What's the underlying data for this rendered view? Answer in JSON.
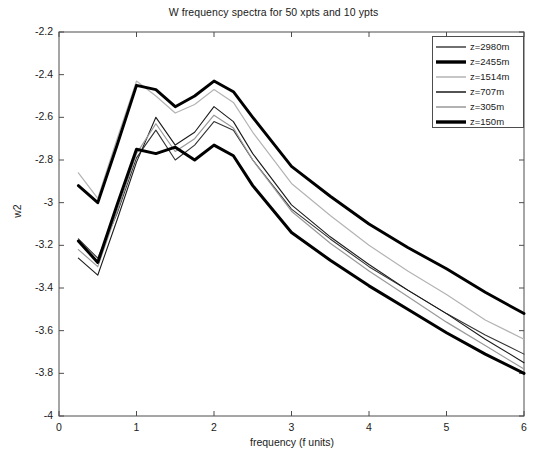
{
  "chart_data": {
    "type": "line",
    "title": "W frequency spectra for 50 xpts and 10 ypts",
    "xlabel": "frequency (f units)",
    "ylabel": "w2",
    "xlim": [
      0,
      6
    ],
    "ylim": [
      -4,
      -2.2
    ],
    "xticks": [
      0,
      1,
      2,
      3,
      4,
      5,
      6
    ],
    "xtick_labels": [
      "0",
      "1",
      "2",
      "3",
      "4",
      "5",
      "6"
    ],
    "yticks": [
      -2.2,
      -2.4,
      -2.6,
      -2.8,
      -3,
      -3.2,
      -3.4,
      -3.6,
      -3.8,
      -4
    ],
    "ytick_labels": [
      "-2.2",
      "-2.4",
      "-2.6",
      "-2.8",
      "-3",
      "-3.2",
      "-3.4",
      "-3.6",
      "-3.8",
      "-4"
    ],
    "grid": false,
    "legend_position": "upper right",
    "x": [
      0.25,
      0.5,
      0.75,
      1.0,
      1.25,
      1.5,
      1.75,
      2.0,
      2.25,
      2.5,
      3.0,
      3.5,
      4.0,
      4.5,
      5.0,
      5.5,
      6.0
    ],
    "series": [
      {
        "name": "z=2980m",
        "color": "#333333",
        "width": 1.1,
        "values": [
          -3.17,
          -3.26,
          -3.05,
          -2.79,
          -2.66,
          -2.8,
          -2.73,
          -2.62,
          -2.66,
          -2.8,
          -3.03,
          -3.17,
          -3.3,
          -3.41,
          -3.52,
          -3.62,
          -3.71
        ]
      },
      {
        "name": "z=2455m",
        "color": "#000000",
        "width": 2.9,
        "values": [
          -2.92,
          -3.0,
          -2.73,
          -2.45,
          -2.47,
          -2.55,
          -2.5,
          -2.43,
          -2.48,
          -2.6,
          -2.83,
          -2.97,
          -3.1,
          -3.21,
          -3.31,
          -3.42,
          -3.52
        ]
      },
      {
        "name": "z=1514m",
        "color": "#b3b3b3",
        "width": 1.2,
        "values": [
          -2.86,
          -2.98,
          -2.7,
          -2.43,
          -2.5,
          -2.58,
          -2.54,
          -2.47,
          -2.53,
          -2.67,
          -2.91,
          -3.06,
          -3.2,
          -3.32,
          -3.43,
          -3.55,
          -3.64
        ]
      },
      {
        "name": "z=707m",
        "color": "#1a1a1a",
        "width": 1.1,
        "values": [
          -3.26,
          -3.34,
          -3.08,
          -2.81,
          -2.6,
          -2.73,
          -2.67,
          -2.55,
          -2.62,
          -2.77,
          -3.01,
          -3.16,
          -3.29,
          -3.41,
          -3.52,
          -3.64,
          -3.75
        ]
      },
      {
        "name": "z=305m",
        "color": "#999999",
        "width": 1.2,
        "values": [
          -3.22,
          -3.3,
          -3.04,
          -2.77,
          -2.63,
          -2.76,
          -2.7,
          -2.59,
          -2.65,
          -2.8,
          -3.04,
          -3.19,
          -3.32,
          -3.44,
          -3.56,
          -3.67,
          -3.78
        ]
      },
      {
        "name": "z=150m",
        "color": "#000000",
        "width": 3.0,
        "values": [
          -3.18,
          -3.28,
          -3.01,
          -2.75,
          -2.77,
          -2.74,
          -2.8,
          -2.73,
          -2.78,
          -2.92,
          -3.14,
          -3.27,
          -3.39,
          -3.5,
          -3.61,
          -3.71,
          -3.8
        ]
      }
    ]
  },
  "legend": {
    "items": [
      {
        "label": "z=2980m"
      },
      {
        "label": "z=2455m"
      },
      {
        "label": "z=1514m"
      },
      {
        "label": "z=707m"
      },
      {
        "label": "z=305m"
      },
      {
        "label": "z=150m"
      }
    ]
  }
}
